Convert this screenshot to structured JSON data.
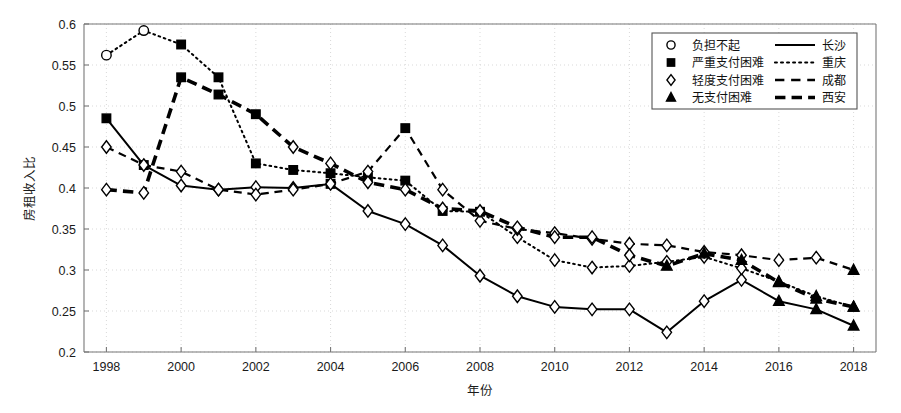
{
  "chart_data": {
    "type": "line",
    "title": "",
    "xlabel": "年份",
    "ylabel": "房租收入比",
    "xlim": [
      1997.4,
      2018.6
    ],
    "ylim": [
      0.2,
      0.6
    ],
    "xticks": [
      1998,
      2000,
      2002,
      2004,
      2006,
      2008,
      2010,
      2012,
      2014,
      2016,
      2018
    ],
    "yticks": [
      0.2,
      0.25,
      0.3,
      0.35,
      0.4,
      0.45,
      0.5,
      0.55,
      0.6
    ],
    "grid": true,
    "legend_position": "top-right",
    "x": [
      1998,
      1999,
      2000,
      2001,
      2002,
      2003,
      2004,
      2005,
      2006,
      2007,
      2008,
      2009,
      2010,
      2011,
      2012,
      2013,
      2014,
      2015,
      2016,
      2017,
      2018
    ],
    "series": [
      {
        "name": "长沙",
        "line_style": "solid",
        "line_width": 2.0,
        "color": "#000000",
        "values": [
          0.485,
          0.428,
          0.403,
          0.398,
          0.401,
          0.4,
          0.405,
          0.372,
          0.356,
          0.33,
          0.293,
          0.268,
          0.255,
          0.252,
          0.252,
          0.224,
          0.262,
          0.288,
          0.262,
          0.252,
          0.232
        ],
        "markers": [
          "square",
          "square",
          "diamond",
          "diamond",
          "diamond",
          "diamond",
          "square",
          "diamond",
          "diamond",
          "diamond",
          "diamond",
          "diamond",
          "diamond",
          "diamond",
          "diamond",
          "diamond",
          "diamond",
          "diamond",
          "triangle",
          "triangle",
          "triangle"
        ]
      },
      {
        "name": "重庆",
        "line_style": "dotted",
        "line_width": 2.0,
        "color": "#000000",
        "values": [
          0.562,
          0.592,
          0.575,
          0.535,
          0.43,
          0.422,
          0.418,
          0.413,
          0.409,
          0.372,
          0.371,
          0.34,
          0.312,
          0.303,
          0.305,
          0.31,
          0.316,
          0.302,
          0.286,
          0.268,
          0.255
        ],
        "markers": [
          "circle",
          "circle",
          "square",
          "square",
          "square",
          "square",
          "square",
          "square",
          "square",
          "square",
          "square",
          "diamond",
          "diamond",
          "diamond",
          "diamond",
          "diamond",
          "diamond",
          "diamond",
          "triangle",
          "triangle",
          "triangle"
        ]
      },
      {
        "name": "成都",
        "line_style": "dashed",
        "line_width": 2.2,
        "color": "#000000",
        "values": [
          0.45,
          0.428,
          0.42,
          0.398,
          0.392,
          0.398,
          0.405,
          0.42,
          0.473,
          0.398,
          0.36,
          0.35,
          0.345,
          0.338,
          0.332,
          0.33,
          0.322,
          0.318,
          0.312,
          0.315,
          0.3
        ],
        "markers": [
          "diamond",
          "diamond",
          "diamond",
          "diamond",
          "diamond",
          "diamond",
          "diamond",
          "diamond",
          "square",
          "diamond",
          "diamond",
          "diamond",
          "diamond",
          "diamond",
          "diamond",
          "diamond",
          "diamond",
          "diamond",
          "diamond",
          "diamond",
          "triangle"
        ]
      },
      {
        "name": "西安",
        "line_style": "thick-dashed",
        "line_width": 3.6,
        "color": "#000000",
        "values": [
          0.398,
          0.394,
          0.535,
          0.514,
          0.49,
          0.45,
          0.43,
          0.407,
          0.398,
          0.375,
          0.372,
          0.352,
          0.34,
          0.34,
          0.318,
          0.305,
          0.32,
          0.312,
          0.285,
          0.265,
          0.255
        ],
        "markers": [
          "diamond",
          "diamond",
          "square",
          "square",
          "square",
          "diamond",
          "diamond",
          "diamond",
          "diamond",
          "diamond",
          "diamond",
          "diamond",
          "diamond",
          "diamond",
          "diamond",
          "triangle",
          "triangle",
          "triangle",
          "triangle",
          "triangle",
          "triangle"
        ]
      }
    ]
  },
  "legend": {
    "markers": [
      {
        "glyph": "circle",
        "label": "负担不起"
      },
      {
        "glyph": "square",
        "label": "严重支付困难"
      },
      {
        "glyph": "diamond",
        "label": "轻度支付困难"
      },
      {
        "glyph": "triangle",
        "label": "无支付困难"
      }
    ],
    "lines": [
      {
        "style": "solid",
        "label": "长沙"
      },
      {
        "style": "dotted",
        "label": "重庆"
      },
      {
        "style": "dashed",
        "label": "成都"
      },
      {
        "style": "thick-dashed",
        "label": "西安"
      }
    ]
  },
  "axes": {
    "y_title": "房租收入比",
    "x_title": "年份",
    "x_tick_labels": [
      "1998",
      "2000",
      "2002",
      "2004",
      "2006",
      "2008",
      "2010",
      "2012",
      "2014",
      "2016",
      "2018"
    ],
    "y_tick_labels": [
      "0.2",
      "0.25",
      "0.3",
      "0.35",
      "0.4",
      "0.45",
      "0.5",
      "0.55",
      "0.6"
    ]
  },
  "colors": {
    "ink": "#000000",
    "axis": "#777777",
    "grid": "#cfcfcf",
    "background": "#ffffff"
  }
}
